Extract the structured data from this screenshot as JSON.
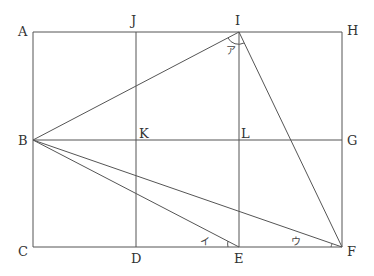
{
  "diagram": {
    "points": {
      "A": {
        "label": "A",
        "x": 33,
        "y": 32
      },
      "J": {
        "label": "J",
        "x": 136,
        "y": 32
      },
      "I": {
        "label": "I",
        "x": 239,
        "y": 32
      },
      "H": {
        "label": "H",
        "x": 342,
        "y": 32
      },
      "B": {
        "label": "B",
        "x": 33,
        "y": 140
      },
      "K": {
        "label": "K",
        "x": 136,
        "y": 140
      },
      "L": {
        "label": "L",
        "x": 239,
        "y": 140
      },
      "G": {
        "label": "G",
        "x": 342,
        "y": 140
      },
      "C": {
        "label": "C",
        "x": 33,
        "y": 247
      },
      "D": {
        "label": "D",
        "x": 136,
        "y": 247
      },
      "E": {
        "label": "E",
        "x": 239,
        "y": 247
      },
      "F": {
        "label": "F",
        "x": 342,
        "y": 247
      }
    },
    "angles": {
      "a": {
        "label": "ア",
        "vertex": "I"
      },
      "i": {
        "label": "イ",
        "vertex": "E"
      },
      "u": {
        "label": "ウ",
        "vertex": "F"
      }
    },
    "segments": [
      "AH",
      "BG",
      "CF",
      "AC",
      "JD",
      "IE",
      "HF",
      "BI",
      "IF",
      "BE",
      "BF"
    ]
  }
}
